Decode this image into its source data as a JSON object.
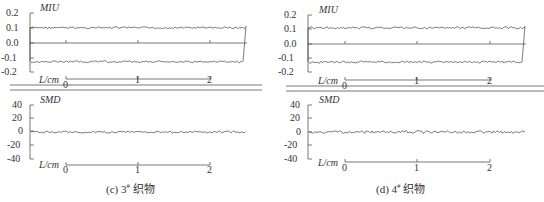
{
  "chart_data": [
    {
      "type": "line",
      "panel": "c",
      "caption": {
        "prefix": "(c) 3",
        "sup": "#",
        "suffix": " 织物"
      },
      "subplots": [
        {
          "name": "MIU",
          "ylabel": "MIU",
          "xlabel": "L/cm",
          "yticks": [
            "0.2",
            "0.1",
            "0.0",
            "-0.1",
            "-0.2"
          ],
          "ylim": [
            -0.2,
            0.2
          ],
          "xticks": [
            "0",
            "1",
            "2"
          ],
          "xlim": [
            0,
            2.5
          ],
          "series": [
            {
              "name": "upper",
              "mean": 0.1,
              "noise": 0.006
            },
            {
              "name": "lower",
              "mean": -0.13,
              "noise": 0.006
            }
          ]
        },
        {
          "name": "SMD",
          "ylabel": "SMD",
          "xlabel": "L/cm",
          "yticks": [
            "40",
            "20",
            "0",
            "-20",
            "-40"
          ],
          "ylim": [
            -40,
            40
          ],
          "xticks": [
            "0",
            "1",
            "2"
          ],
          "xlim": [
            0,
            2.5
          ],
          "series": [
            {
              "name": "SMD",
              "mean": 0,
              "noise": 1.5
            }
          ]
        }
      ]
    },
    {
      "type": "line",
      "panel": "d",
      "caption": {
        "prefix": "(d) 4",
        "sup": "#",
        "suffix": " 织物"
      },
      "subplots": [
        {
          "name": "MIU",
          "ylabel": "MIU",
          "xlabel": "L/cm",
          "yticks": [
            "0.2",
            "0.1",
            "0.0",
            "-0.1",
            "-0.2"
          ],
          "ylim": [
            -0.2,
            0.2
          ],
          "xticks": [
            "0",
            "1",
            "2"
          ],
          "xlim": [
            0,
            2.5
          ],
          "series": [
            {
              "name": "upper",
              "mean": 0.11,
              "noise": 0.007
            },
            {
              "name": "lower",
              "mean": -0.13,
              "noise": 0.007
            }
          ]
        },
        {
          "name": "SMD",
          "ylabel": "SMD",
          "xlabel": "L/cm",
          "yticks": [
            "40",
            "20",
            "0",
            "-20",
            "-40"
          ],
          "ylim": [
            -40,
            40
          ],
          "xticks": [
            "0",
            "1",
            "2"
          ],
          "xlim": [
            0,
            2.5
          ],
          "series": [
            {
              "name": "SMD",
              "mean": 0,
              "noise": 1.8
            }
          ]
        }
      ]
    }
  ]
}
